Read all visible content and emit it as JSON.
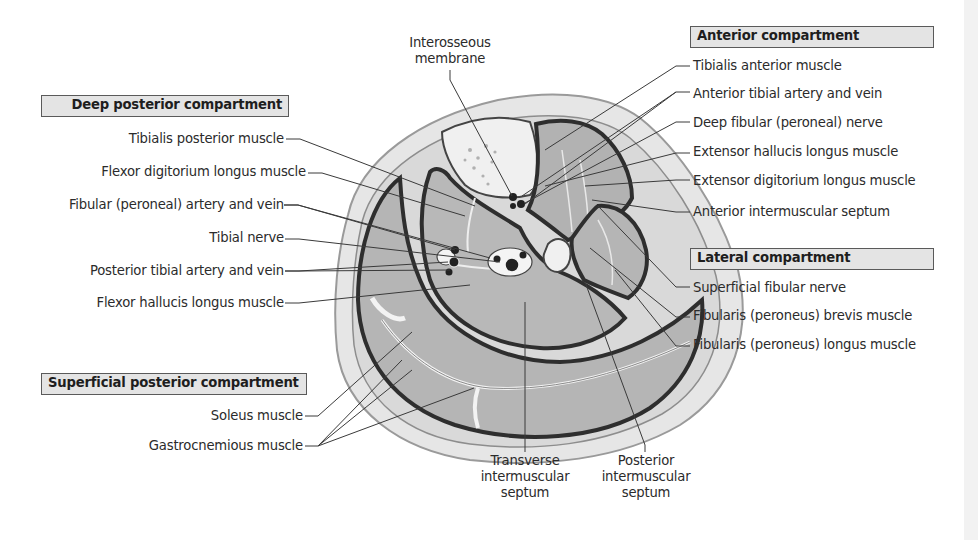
{
  "diagram": {
    "colors": {
      "skin": "#e6e6e6",
      "skin_outline": "#9a9a9a",
      "muscle": "#b5b5b5",
      "muscle_dark": "#a9a9a9",
      "fascia": "#3a3a3a",
      "bone": "#f0f0f0",
      "box_fill": "#e4e4e4",
      "box_border": "#5a5a5a",
      "leader": "#3a3a3a"
    }
  },
  "compartments": {
    "deep_posterior": {
      "heading": "Deep posterior compartment",
      "items": [
        "Tibialis posterior muscle",
        "Flexor digitorium longus muscle",
        "Fibular (peroneal) artery and vein",
        "Tibial nerve",
        "Posterior tibial artery and vein",
        "Flexor hallucis longus muscle"
      ]
    },
    "superficial_posterior": {
      "heading": "Superficial posterior compartment",
      "items": [
        "Soleus muscle",
        "Gastrocnemious muscle"
      ]
    },
    "anterior": {
      "heading": "Anterior compartment",
      "items": [
        "Tibialis anterior muscle",
        "Anterior tibial artery and vein",
        "Deep fibular (peroneal) nerve",
        "Extensor hallucis longus muscle",
        "Extensor digitorium longus muscle",
        "Anterior intermuscular septum"
      ]
    },
    "lateral": {
      "heading": "Lateral compartment",
      "items": [
        "Superficial fibular nerve",
        "Fibularis (peroneus) brevis muscle",
        "Fibularis (peroneus) longus muscle"
      ]
    }
  },
  "other_labels": {
    "interosseous": "Interosseous membrane",
    "transverse_septum": "Transverse intermuscular septum",
    "posterior_septum": "Posterior intermuscular septum"
  }
}
